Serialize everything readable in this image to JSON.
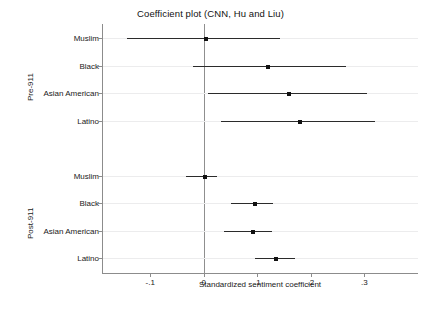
{
  "chart_data": {
    "type": "scatter",
    "title": "Coefficient plot (CNN, Hu and Liu)",
    "xlabel": "Standardized sentiment coefficient",
    "ylabel": "",
    "xlim": [
      -0.19,
      0.4
    ],
    "xticks": [
      -0.1,
      0,
      0.1,
      0.2,
      0.3
    ],
    "xticklabels": [
      "-.1",
      "0",
      ".1",
      ".2",
      ".3"
    ],
    "grid": true,
    "legend": "none",
    "reference_line": 0,
    "groups": [
      {
        "name": "Pre-911",
        "rows": [
          {
            "label": "Muslim",
            "estimate": 0.005,
            "ci_low": -0.143,
            "ci_high": 0.143
          },
          {
            "label": "Black",
            "estimate": 0.12,
            "ci_low": -0.02,
            "ci_high": 0.265
          },
          {
            "label": "Asian American",
            "estimate": 0.16,
            "ci_low": 0.008,
            "ci_high": 0.305
          },
          {
            "label": "Latino",
            "estimate": 0.18,
            "ci_low": 0.033,
            "ci_high": 0.32
          }
        ]
      },
      {
        "name": "Post-911",
        "rows": [
          {
            "label": "Muslim",
            "estimate": 0.002,
            "ci_low": -0.033,
            "ci_high": 0.025
          },
          {
            "label": "Black",
            "estimate": 0.095,
            "ci_low": 0.05,
            "ci_high": 0.13
          },
          {
            "label": "Asian American",
            "estimate": 0.092,
            "ci_low": 0.038,
            "ci_high": 0.127
          },
          {
            "label": "Latino",
            "estimate": 0.135,
            "ci_low": 0.095,
            "ci_high": 0.17
          }
        ]
      }
    ],
    "colors": {
      "marker": "#111111",
      "ci_line": "#2b2b2b",
      "axis": "#8c8c8c",
      "grid": "#ececed",
      "reference_line": "#8f8f8f",
      "text": "#1a1a1a",
      "background": "#ffffff"
    }
  }
}
